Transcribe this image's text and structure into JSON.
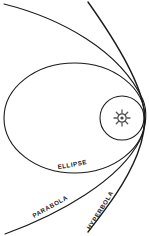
{
  "diagram": {
    "type": "orbit-conic-sections",
    "colors": {
      "line": "#1a1a1a",
      "background": "#ffffff",
      "sun": "#444444"
    },
    "labels": {
      "ellipse": "ELLIPSE",
      "parabola": "PARABOLA",
      "hyperbola": "HYPERBOLA"
    },
    "elements": [
      {
        "name": "ellipse",
        "shape": "ellipse",
        "cx": 74.5,
        "cy": 118,
        "rx": 70.5,
        "ry": 55
      },
      {
        "name": "circle",
        "shape": "circle",
        "cx": 122,
        "cy": 118,
        "r": 22
      },
      {
        "name": "parabola",
        "shape": "curve"
      },
      {
        "name": "hyperbola",
        "shape": "curve"
      },
      {
        "name": "sun",
        "shape": "sun-glyph",
        "cx": 122,
        "cy": 118
      }
    ]
  }
}
